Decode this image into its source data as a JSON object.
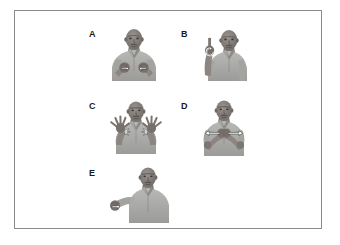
{
  "figure": {
    "name": "sign-language-gesture-figure",
    "background_color": "#ffffff",
    "frame_color": "#8a8a8a",
    "frame": {
      "x": 14,
      "y": 10,
      "width": 308,
      "height": 219
    },
    "label_color": "#1a1a1a",
    "photo_style": "grayscale",
    "annotation_color": "#ffffff",
    "annotation_outline": "#1a1a1a",
    "panels": [
      {
        "id": "panel-a",
        "label": "A",
        "label_x": 88,
        "label_y": 29,
        "photo_x": 108,
        "photo_y": 26,
        "photo_width": 50,
        "photo_height": 54,
        "description": "man with both closed fists held at chest level, small white arrows on each fist",
        "hand_pose": "two-fists-chest",
        "annotation": "small-arrows-both-hands"
      },
      {
        "id": "panel-b",
        "label": "B",
        "label_x": 180,
        "label_y": 29,
        "photo_x": 196,
        "photo_y": 26,
        "photo_width": 50,
        "photo_height": 54,
        "description": "man with right hand raised beside head, index finger extended upward, circular arrow annotation",
        "hand_pose": "index-finger-up",
        "annotation": "circular-arrow-one-hand"
      },
      {
        "id": "panel-c",
        "label": "C",
        "label_x": 88,
        "label_y": 101,
        "photo_x": 106,
        "photo_y": 99,
        "photo_width": 58,
        "photo_height": 54,
        "description": "man with both hands open, fingers spread wide at chest level, starburst motion annotations",
        "hand_pose": "two-open-hands-spread",
        "annotation": "starburst-both-hands"
      },
      {
        "id": "panel-d",
        "label": "D",
        "label_x": 180,
        "label_y": 101,
        "photo_x": 192,
        "photo_y": 99,
        "photo_width": 62,
        "photo_height": 56,
        "description": "man with both hands meeting at center of chest, horizontal double arrows pointing outward to both sides",
        "hand_pose": "hands-together-center",
        "annotation": "horizontal-outward-arrows"
      },
      {
        "id": "panel-e",
        "label": "E",
        "label_x": 88,
        "label_y": 168,
        "photo_x": 106,
        "photo_y": 166,
        "photo_width": 70,
        "photo_height": 56,
        "description": "man with right arm extended forward and down, hand closed in a fist, arrow annotation",
        "hand_pose": "extended-arm-fist",
        "annotation": "small-arrow-one-hand"
      }
    ]
  }
}
